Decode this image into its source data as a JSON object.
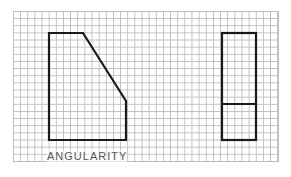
{
  "diagram": {
    "label": "ANGULARITY",
    "colors": {
      "grid": "#bdbdbd",
      "outline": "#1a1a1a",
      "label": "#555555"
    },
    "left_shape": {
      "points": [
        [
          49,
          33
        ],
        [
          83,
          33
        ],
        [
          126,
          101
        ],
        [
          126,
          140
        ],
        [
          49,
          140
        ]
      ]
    },
    "right_shape": {
      "rect": [
        222,
        33,
        34,
        107
      ],
      "divider_y": 104
    }
  }
}
